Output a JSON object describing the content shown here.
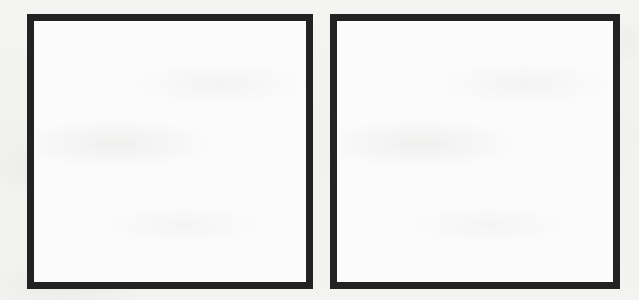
{
  "page": {
    "kind": "scanned-page-with-blank-frames",
    "background_color": "#f2f2f0",
    "panel_count": 2
  },
  "style": {
    "frame_border_color": "#222222",
    "frame_interior_color": "#fbfbfb",
    "frame_border_width_px": 7
  },
  "panels": [
    {
      "id": "left",
      "label": "",
      "content": "",
      "interior_color": "#fbfbfb",
      "border_color": "#222222"
    },
    {
      "id": "right",
      "label": "",
      "content": "",
      "interior_color": "#fbfbfb",
      "border_color": "#222222"
    }
  ]
}
